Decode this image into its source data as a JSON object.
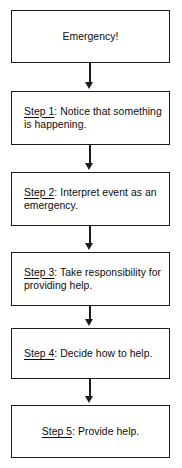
{
  "diagram": {
    "orientation": "vertical-top-down",
    "background_color": "#ffffff",
    "box_border_color": "#1c1c1c",
    "text_color": "#0d0d0d",
    "nodes": [
      {
        "id": "node-emergency",
        "label_prefix": "",
        "text": "Emergency!",
        "align": "center",
        "top": 10,
        "height": 53
      },
      {
        "id": "node-step-1",
        "label_prefix": "Step 1",
        "text": ": Notice that something is happening.",
        "align": "left",
        "top": 91,
        "height": 54
      },
      {
        "id": "node-step-2",
        "label_prefix": "Step 2",
        "text": ": Interpret event as an emergency.",
        "align": "left",
        "top": 172,
        "height": 54
      },
      {
        "id": "node-step-3",
        "label_prefix": "Step 3",
        "text": ": Take responsibility for providing help.",
        "align": "left",
        "top": 252,
        "height": 54
      },
      {
        "id": "node-step-4",
        "label_prefix": "Step 4",
        "text": ": Decide how to help.",
        "align": "left",
        "top": 328,
        "height": 51
      },
      {
        "id": "node-step-5",
        "label_prefix": "Step 5",
        "text": ": Provide help.",
        "align": "center",
        "top": 405,
        "height": 53
      }
    ],
    "arrows": [
      {
        "id": "arrow-1",
        "from": "node-emergency",
        "to": "node-step-1",
        "top": 63,
        "length": 21
      },
      {
        "id": "arrow-2",
        "from": "node-step-1",
        "to": "node-step-2",
        "top": 145,
        "length": 20
      },
      {
        "id": "arrow-3",
        "from": "node-step-2",
        "to": "node-step-3",
        "top": 226,
        "length": 19
      },
      {
        "id": "arrow-4",
        "from": "node-step-3",
        "to": "node-step-4",
        "top": 306,
        "length": 15
      },
      {
        "id": "arrow-5",
        "from": "node-step-4",
        "to": "node-step-5",
        "top": 379,
        "length": 19
      }
    ]
  }
}
